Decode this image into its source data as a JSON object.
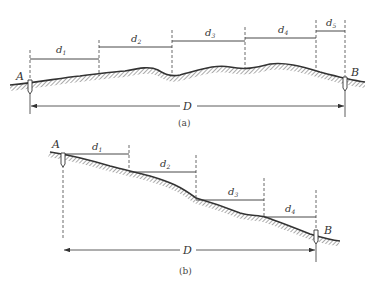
{
  "figure_a": {
    "caption": "(a)",
    "point_start": "A",
    "point_end": "B",
    "total_label": "D",
    "segments": [
      {
        "label": "d",
        "sub": "1"
      },
      {
        "label": "d",
        "sub": "2"
      },
      {
        "label": "d",
        "sub": "3"
      },
      {
        "label": "d",
        "sub": "4"
      },
      {
        "label": "d",
        "sub": "5"
      }
    ]
  },
  "figure_b": {
    "caption": "(b)",
    "point_start": "A",
    "point_end": "B",
    "total_label": "D",
    "segments": [
      {
        "label": "d",
        "sub": "1"
      },
      {
        "label": "d",
        "sub": "2"
      },
      {
        "label": "d",
        "sub": "3"
      },
      {
        "label": "d",
        "sub": "4"
      }
    ]
  },
  "colors": {
    "line": "#333333",
    "hatch": "#555555",
    "background": "#ffffff"
  }
}
